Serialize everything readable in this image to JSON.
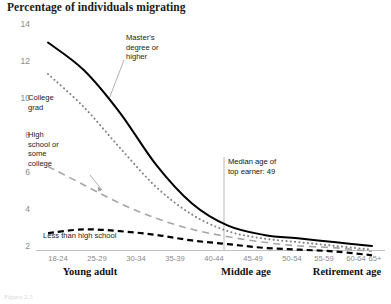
{
  "chart_data": {
    "type": "line",
    "title": "Percentage of individuals migrating",
    "xlabel": "",
    "ylabel": "",
    "ylim": [
      1,
      14
    ],
    "yticks": [
      2,
      4,
      6,
      8,
      10,
      12,
      14
    ],
    "grid": false,
    "legend_position": "inline-annotations",
    "categories": [
      "18-24",
      "25-29",
      "30-34",
      "35-39",
      "40-44",
      "45-49",
      "50-54",
      "55-59",
      "60-64",
      "65+"
    ],
    "series": [
      {
        "name": "Master's degree or higher",
        "style": "solid",
        "color": "#000000",
        "values": [
          13.0,
          11.5,
          9.2,
          6.4,
          4.3,
          3.1,
          2.6,
          2.4,
          2.2,
          2.0
        ]
      },
      {
        "name": "College grad",
        "style": "dotted",
        "color": "#808080",
        "values": [
          11.3,
          9.5,
          7.3,
          5.2,
          3.7,
          2.8,
          2.4,
          2.2,
          2.0,
          1.8
        ]
      },
      {
        "name": "High school or some college",
        "style": "dashed",
        "color": "#a6a6a6",
        "values": [
          6.3,
          5.3,
          4.3,
          3.5,
          2.9,
          2.5,
          2.2,
          2.0,
          1.9,
          1.7
        ]
      },
      {
        "name": "Less than high school",
        "style": "dashed-bold",
        "color": "#000000",
        "values": [
          2.7,
          2.9,
          2.8,
          2.6,
          2.3,
          2.1,
          1.9,
          1.8,
          1.7,
          1.5
        ]
      }
    ],
    "annotations": [
      {
        "id": "masters",
        "text": "Master's\ndegree or\nhigher",
        "target_series": "Master's degree or higher"
      },
      {
        "id": "college-grad",
        "text": "College\ngrad",
        "target_series": "College grad"
      },
      {
        "id": "high-school",
        "text": "High\nschool or\nsome\ncollege",
        "target_series": "High school or some college"
      },
      {
        "id": "less-than-high-school",
        "text": "Less than high school",
        "target_series": "Less than high school"
      },
      {
        "id": "median-age",
        "text": "Median age of\ntop earner: 49",
        "marker_value": 49,
        "marker_category": "45-49"
      }
    ],
    "axis_groups": [
      {
        "label": "Young adult",
        "from": "18-24",
        "to": "30-34"
      },
      {
        "label": "Middle age",
        "from": "40-44",
        "to": "50-54"
      },
      {
        "label": "Retirement age",
        "from": "60-64",
        "to": "65+"
      }
    ]
  },
  "caption": "Figure 2.5"
}
